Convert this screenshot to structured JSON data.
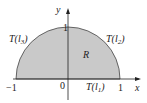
{
  "diagram": {
    "title": "",
    "region_label": "R",
    "axes": {
      "x_label": "x",
      "y_label": "y",
      "x_ticks": [
        "−1",
        "0",
        "1"
      ],
      "y_ticks": [
        "1"
      ]
    },
    "boundary_labels": {
      "bottom": "T(l1)",
      "right_arc": "T(l2)",
      "left_arc": "T(l3)"
    },
    "colors": {
      "fill": "#c9c9c9",
      "stroke": "#333333",
      "background": "#ffffff"
    },
    "shape": "upper half unit disk"
  }
}
